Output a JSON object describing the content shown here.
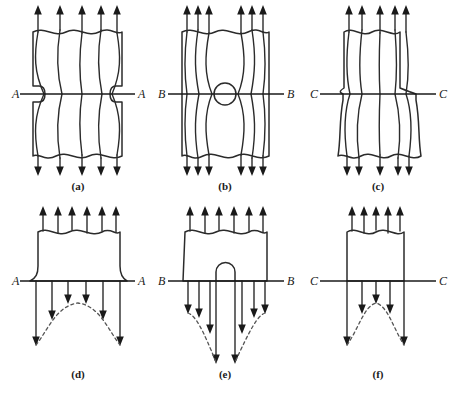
{
  "figure": {
    "background_color": "#ffffff",
    "line_color": "#2b2b2b",
    "dashed_curve_color": "#555555",
    "panels": [
      {
        "id": "a",
        "caption": "(a)",
        "section_label": "A",
        "section_label_left": "A",
        "section_label_right": "A",
        "feature": "double semicircular notch",
        "row": "top",
        "flow_lines": 5,
        "top_arrows": 5,
        "bottom_arrows": 5,
        "description": "Uniform bar with opposing semicircular side notches; flow lines crowd near notch roots"
      },
      {
        "id": "b",
        "caption": "(b)",
        "section_label": "B",
        "section_label_left": "B",
        "section_label_right": "B",
        "feature": "central circular hole",
        "row": "top",
        "flow_lines": 6,
        "top_arrows": 6,
        "bottom_arrows": 6,
        "description": "Bar with central circular hole; flow lines divert around the hole"
      },
      {
        "id": "c",
        "caption": "(c)",
        "section_label": "C",
        "section_label_left": "C",
        "section_label_right": "C",
        "feature": "stepped shoulder fillet",
        "row": "top",
        "flow_lines": 5,
        "top_arrows": 5,
        "bottom_arrows": 5,
        "description": "Stepped bar, narrow above and wide below section C-C; flow lines fan out at the shoulder"
      },
      {
        "id": "d",
        "caption": "(d)",
        "section_label": "A",
        "section_label_left": "A",
        "section_label_right": "A",
        "feature": "stress distribution at notched section A-A",
        "row": "bottom",
        "top_arrows": 6,
        "distribution_arrows": 6,
        "description": "Stress distribution across section A-A: peak stress at notch roots, lower in centre"
      },
      {
        "id": "e",
        "caption": "(e)",
        "section_label": "B",
        "section_label_left": "B",
        "section_label_right": "B",
        "feature": "stress distribution at holed section B-B",
        "row": "bottom",
        "top_arrows": 6,
        "distribution_arrows": 8,
        "description": "Stress distribution across section B-B: very high peak stress at the hole edges"
      },
      {
        "id": "f",
        "caption": "(f)",
        "section_label": "C",
        "section_label_left": "C",
        "section_label_right": "C",
        "feature": "stress distribution at stepped section C-C",
        "row": "bottom",
        "top_arrows": 5,
        "distribution_arrows": 5,
        "description": "Stress distribution across section C-C: peak stress at the fillet corners"
      }
    ]
  }
}
